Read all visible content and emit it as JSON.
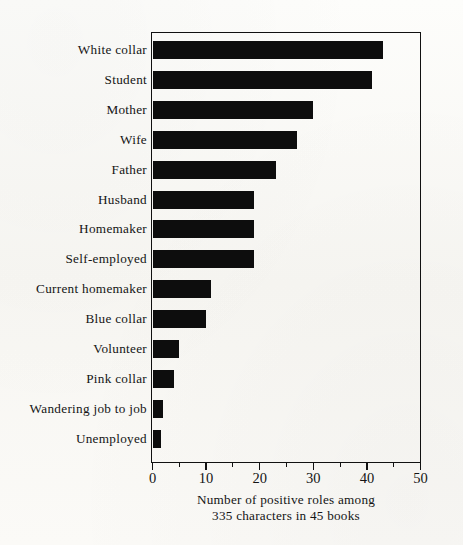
{
  "chart_data": {
    "type": "bar",
    "orientation": "horizontal",
    "title": "",
    "xlabel": "Number of positive roles among 335 characters in 45 books",
    "ylabel": "",
    "xlim": [
      0,
      50
    ],
    "xticks": [
      0,
      10,
      20,
      30,
      40,
      50
    ],
    "xtick_labels": [
      "0",
      "10",
      "20",
      "30",
      "40",
      "50"
    ],
    "minor_tick_interval": 5,
    "grid": false,
    "legend": null,
    "bar_color": "#0d0d0d",
    "categories": [
      "White collar",
      "Student",
      "Mother",
      "Wife",
      "Father",
      "Husband",
      "Homemaker",
      "Self-employed",
      "Current homemaker",
      "Blue collar",
      "Volunteer",
      "Pink collar",
      "Wandering job to job",
      "Unemployed"
    ],
    "values": [
      43,
      41,
      30,
      27,
      23,
      19,
      19,
      19,
      11,
      10,
      5,
      4,
      2,
      1.5
    ]
  },
  "caption": {
    "line1": "Number of positive roles among",
    "line2": "335 characters in 45 books"
  }
}
